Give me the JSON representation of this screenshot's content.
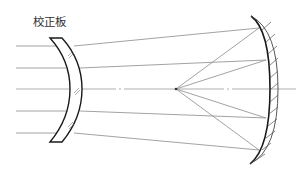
{
  "diagram": {
    "title_label": "校正板",
    "type": "Schmidt camera optical schematic",
    "components": [
      {
        "name": "corrector-plate",
        "label": "校正板"
      },
      {
        "name": "spherical-mirror",
        "label": ""
      },
      {
        "name": "focal-point",
        "label": ""
      },
      {
        "name": "optical-axis",
        "label": ""
      }
    ],
    "incoming_rays_count": 5,
    "colors": {
      "line": "#1a1a1a",
      "ray": "#8a8a8a",
      "background": "#ffffff"
    }
  }
}
